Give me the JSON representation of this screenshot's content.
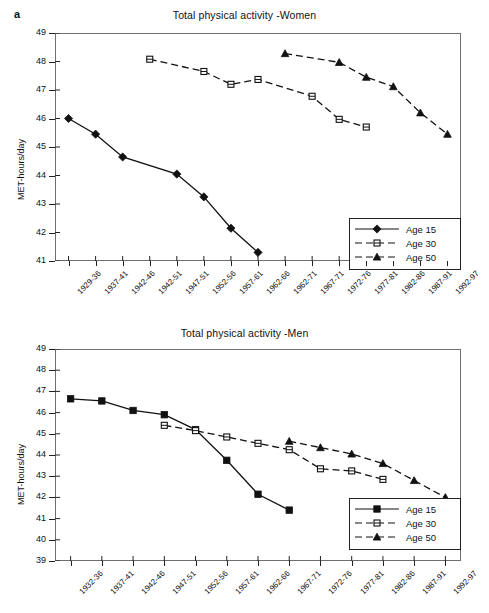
{
  "panel_letter": "a",
  "chart_data": [
    {
      "type": "line",
      "title": "Total physical activity -Women",
      "xlabel": "",
      "ylabel": "MET-hours/day",
      "ylim": [
        41,
        49
      ],
      "yticks": [
        41,
        42,
        43,
        44,
        45,
        46,
        47,
        48,
        49
      ],
      "grid": false,
      "legend_position": "bottom-right",
      "categories": [
        "1929-36",
        "1937-41",
        "1942-46",
        "1942-51",
        "1947-51",
        "1952-56",
        "1957-61",
        "1962-66",
        "1962-71",
        "1967-71",
        "1972-76",
        "1977-81",
        "1982-86",
        "1987-91",
        "1992-97"
      ],
      "series": [
        {
          "name": "Age 15",
          "marker": "diamond-filled",
          "linestyle": "solid",
          "color": "#111111",
          "x": [
            "1929-36",
            "1937-41",
            "1942-46",
            "1947-51",
            "1952-56",
            "1957-61",
            "1962-66"
          ],
          "values": [
            46.0,
            45.45,
            44.65,
            44.05,
            43.25,
            42.15,
            41.3
          ]
        },
        {
          "name": "Age 30",
          "marker": "square-open",
          "linestyle": "dashed",
          "color": "#111111",
          "x": [
            "1942-51",
            "1952-56",
            "1957-61",
            "1962-66",
            "1967-71",
            "1972-76",
            "1977-81"
          ],
          "values": [
            48.08,
            47.65,
            47.2,
            47.37,
            46.78,
            45.97,
            45.7
          ]
        },
        {
          "name": "Age 50",
          "marker": "triangle-filled",
          "linestyle": "dashed",
          "color": "#111111",
          "x": [
            "1962-71",
            "1972-76",
            "1977-81",
            "1982-86",
            "1987-91",
            "1992-97"
          ],
          "values": [
            48.28,
            47.97,
            47.45,
            47.12,
            46.2,
            45.45
          ]
        }
      ]
    },
    {
      "type": "line",
      "title": "Total physical activity -Men",
      "xlabel": "",
      "ylabel": "MET-hours/day",
      "ylim": [
        39,
        49
      ],
      "yticks": [
        39,
        40,
        41,
        42,
        43,
        44,
        45,
        46,
        47,
        48,
        49
      ],
      "grid": false,
      "legend_position": "bottom-right",
      "categories": [
        "1932-36",
        "1937-41",
        "1942-46",
        "1947-51",
        "1952-56",
        "1957-61",
        "1962-66",
        "1967-71",
        "1972-76",
        "1977-81",
        "1982-86",
        "1987-91",
        "1992-97"
      ],
      "series": [
        {
          "name": "Age 15",
          "marker": "square-filled",
          "linestyle": "solid",
          "color": "#111111",
          "x": [
            "1932-36",
            "1937-41",
            "1942-46",
            "1947-51",
            "1952-56",
            "1957-61",
            "1962-66",
            "1967-71"
          ],
          "values": [
            46.65,
            46.55,
            46.1,
            45.9,
            45.2,
            43.75,
            42.15,
            41.4
          ]
        },
        {
          "name": "Age 30",
          "marker": "square-open",
          "linestyle": "dashed",
          "color": "#111111",
          "x": [
            "1947-51",
            "1952-56",
            "1957-61",
            "1962-66",
            "1967-71",
            "1972-76",
            "1977-81",
            "1982-86"
          ],
          "values": [
            45.4,
            45.15,
            44.85,
            44.55,
            44.25,
            43.35,
            43.25,
            42.85
          ]
        },
        {
          "name": "Age 50",
          "marker": "triangle-filled",
          "linestyle": "dashed",
          "color": "#111111",
          "x": [
            "1967-71",
            "1972-76",
            "1977-81",
            "1982-86",
            "1987-91",
            "1992-97"
          ],
          "values": [
            44.65,
            44.35,
            44.05,
            43.6,
            42.8,
            42.0
          ]
        }
      ]
    }
  ]
}
